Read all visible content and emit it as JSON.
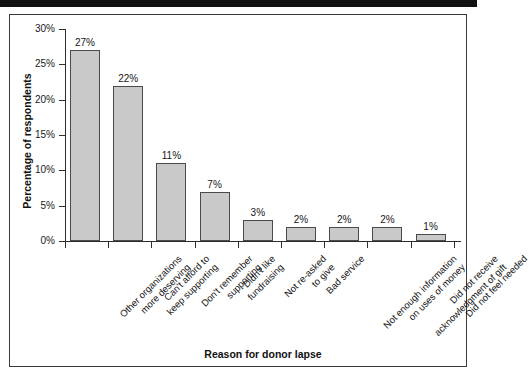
{
  "figure": {
    "frame_color": "#3a3a3a",
    "top_rule_color": "#111111"
  },
  "chart_data": {
    "type": "bar",
    "title": "",
    "xlabel": "Reason for donor lapse",
    "ylabel": "Percentage of respondents",
    "ylim": [
      0,
      30
    ],
    "ytick_labels": [
      "0%",
      "5%",
      "10%",
      "15%",
      "20%",
      "25%",
      "30%"
    ],
    "ytick_values": [
      0,
      5,
      10,
      15,
      20,
      25,
      30
    ],
    "grid": false,
    "legend": null,
    "bar_color": "#c9c9c9",
    "bar_edge_color": "#4a4a4a",
    "categories": [
      "Other organizations more deserving",
      "Can't afford to keep supporting",
      "Don't remember supporting",
      "Didn't like fundraising",
      "Not re-asked to give",
      "Bad service",
      "Not enough information on uses of money",
      "Did not receive acknowledgment of gift",
      "Did not feel needed"
    ],
    "category_lines": [
      [
        "Other organizations",
        "more deserving"
      ],
      [
        "Can't afford to",
        "keep supporting"
      ],
      [
        "Don't remember",
        "supporting"
      ],
      [
        "Didn't like",
        "fundraising"
      ],
      [
        "Not re-asked",
        "to give"
      ],
      [
        "Bad service"
      ],
      [
        "Not enough information",
        "on uses of money"
      ],
      [
        "Did not receive",
        "acknowledgment of gift"
      ],
      [
        "Did not feel needed"
      ]
    ],
    "values": [
      27,
      22,
      11,
      7,
      3,
      2,
      2,
      2,
      1
    ],
    "value_labels": [
      "27%",
      "22%",
      "11%",
      "7%",
      "3%",
      "2%",
      "2%",
      "2%",
      "1%"
    ]
  }
}
